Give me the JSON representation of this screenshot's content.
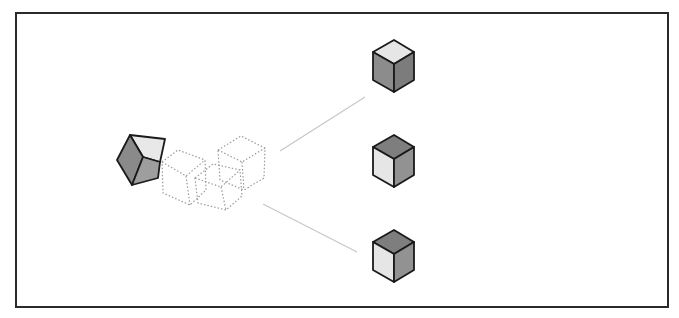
{
  "diagram": {
    "type": "cube-decomposition",
    "colors": {
      "border": "#2a2a2a",
      "edge": "#1a1a1a",
      "light_face": "#e6e6e6",
      "mid_face": "#9a9a9a",
      "dark_face": "#7e7e7e",
      "connector": "#c8c8c8",
      "ghost": "#9a9a9a"
    },
    "source_cube": {
      "label": ""
    },
    "ghost_cubes": 3,
    "target_cubes": [
      {
        "position": "top",
        "top_face": "light",
        "left_face": "mid",
        "right_face": "dark"
      },
      {
        "position": "middle",
        "top_face": "dark",
        "left_face": "light",
        "right_face": "mid"
      },
      {
        "position": "bottom",
        "top_face": "dark",
        "left_face": "light",
        "right_face": "mid"
      }
    ]
  }
}
